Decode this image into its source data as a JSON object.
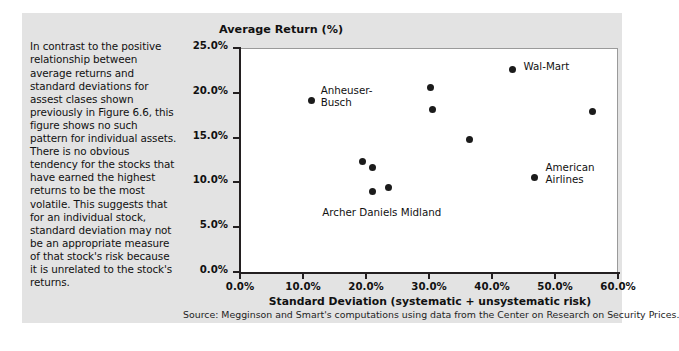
{
  "caption": {
    "text": "In contrast to the positive relationship between average returns and standard deviations for assest clases shown previously in Figure 6.6, this figure shows no such pattern for individual assets. There is no obvious tendency for the stocks that have earned the highest returns to be the most volatile. This suggests that for an individual stock, standard deviation may not be an appropriate measure of that stock's risk because it is unrelated to the stock's returns."
  },
  "source": {
    "text": "Source: Megginson and Smart's computations using data from the Center on Research on Security Prices."
  },
  "chart_data": {
    "type": "scatter",
    "title": "Average Return (%)",
    "xlabel": "Standard Deviation (systematic + unsystematic risk)",
    "ylabel": "Average Return (%)",
    "xlim": [
      0,
      60
    ],
    "ylim": [
      0,
      25
    ],
    "grid": false,
    "legend": "none",
    "xticks": [
      "0.0%",
      "10.0%",
      "20.0%",
      "30.0%",
      "40.0%",
      "50.0%",
      "60.0%"
    ],
    "xtick_values": [
      0,
      10,
      20,
      30,
      40,
      50,
      60
    ],
    "yticks": [
      "0.0%",
      "5.0%",
      "10.0%",
      "15.0%",
      "20.0%",
      "25.0%"
    ],
    "ytick_values": [
      0,
      5,
      10,
      15,
      20,
      25
    ],
    "points": [
      {
        "label": "Anheuser-Busch",
        "x": 11.3,
        "y": 19.1,
        "label_pos": "right",
        "label_dx": 8,
        "label_dy": -11
      },
      {
        "label": "Wal-Mart",
        "x": 43.3,
        "y": 22.6,
        "label_pos": "right",
        "label_dx": 9,
        "label_dy": -6
      },
      {
        "label": "",
        "x": 30.2,
        "y": 20.6,
        "label_pos": "none",
        "label_dx": 0,
        "label_dy": 0
      },
      {
        "label": "",
        "x": 30.6,
        "y": 18.1,
        "label_pos": "none",
        "label_dx": 0,
        "label_dy": 0
      },
      {
        "label": "",
        "x": 36.5,
        "y": 14.8,
        "label_pos": "none",
        "label_dx": 0,
        "label_dy": 0
      },
      {
        "label": "",
        "x": 55.9,
        "y": 17.9,
        "label_pos": "none",
        "label_dx": 0,
        "label_dy": 0
      },
      {
        "label": "American Airlines",
        "x": 46.8,
        "y": 10.6,
        "label_pos": "right",
        "label_dx": 9,
        "label_dy": -11
      },
      {
        "label": "",
        "x": 19.5,
        "y": 12.3,
        "label_pos": "none",
        "label_dx": 0,
        "label_dy": 0
      },
      {
        "label": "",
        "x": 21.0,
        "y": 11.7,
        "label_pos": "none",
        "label_dx": 0,
        "label_dy": 0
      },
      {
        "label": "",
        "x": 21.0,
        "y": 9.0,
        "label_pos": "none",
        "label_dx": 0,
        "label_dy": 0
      },
      {
        "label": "",
        "x": 23.5,
        "y": 9.4,
        "label_pos": "none",
        "label_dx": 0,
        "label_dy": 0
      }
    ],
    "annotations": [
      {
        "text": "Anheuser-\nBusch",
        "x": 12.8,
        "y": 20.2
      },
      {
        "text": "Wal-Mart",
        "x": 45.0,
        "y": 22.9
      },
      {
        "text": "American\nAirlines",
        "x": 48.5,
        "y": 11.6
      },
      {
        "text": "Archer Daniels Midland",
        "x": 22.5,
        "y": 6.6
      }
    ],
    "colors": {
      "marker": "#1b1b1b",
      "axis": "#231f20",
      "plot_background": "#ffffff",
      "figure_background": "#e3e3e3",
      "text": "#111111"
    }
  }
}
